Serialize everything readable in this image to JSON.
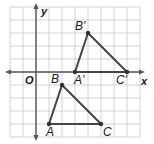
{
  "figure": {
    "axes": {
      "x_label": "x",
      "y_label": "y",
      "origin_label": "O"
    },
    "grid": {
      "x_min": -2,
      "x_max": 8,
      "y_min": -5,
      "y_max": 5,
      "cell_px": 13,
      "origin_px": [
        36,
        72
      ]
    },
    "colors": {
      "grid": "#c8c8c8",
      "axis": "#555555",
      "triangle": "#444444",
      "point": "#333333",
      "label": "#1a1a1a"
    },
    "triangles": [
      {
        "name": "original",
        "points": [
          {
            "label": "A",
            "x": 1,
            "y": -4
          },
          {
            "label": "B",
            "x": 2,
            "y": -1
          },
          {
            "label": "C",
            "x": 5,
            "y": -4
          }
        ]
      },
      {
        "name": "image",
        "points": [
          {
            "label": "A'",
            "x": 3,
            "y": 0
          },
          {
            "label": "B'",
            "x": 4,
            "y": 3
          },
          {
            "label": "C'",
            "x": 7,
            "y": 0
          }
        ]
      }
    ],
    "translation": {
      "dx": 2,
      "dy": 4
    }
  }
}
